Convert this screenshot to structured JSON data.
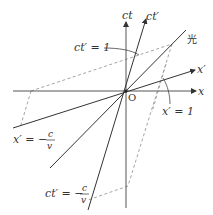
{
  "diagram": {
    "type": "minkowski-spacetime-diagram",
    "colors": {
      "axis": "#555555",
      "line": "#333333",
      "dashed": "#999999",
      "text": "#333333"
    },
    "origin": {
      "label": "O"
    },
    "axes": {
      "x": {
        "label": "x"
      },
      "ct": {
        "label": "ct"
      },
      "x_prime": {
        "label": "x′"
      },
      "ct_prime": {
        "label": "ct′"
      }
    },
    "light_line": {
      "label": "光"
    },
    "annotations": {
      "ct_prime_eq_1": "ct′ = 1",
      "x_prime_eq_1": "x′ = 1",
      "x_prime_eq_neg": {
        "lhs": "x′ = −",
        "num": "c",
        "den": "v"
      },
      "ct_prime_eq_neg": {
        "lhs": "ct′ = −",
        "num": "c",
        "den": "v"
      }
    }
  }
}
